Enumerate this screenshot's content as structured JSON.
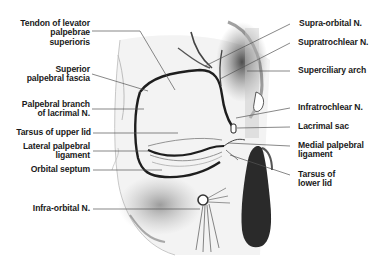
{
  "diagram": {
    "colors": {
      "background": "#ffffff",
      "label_text": "#1a1a1a",
      "leader_line": "#555555",
      "outline": "#1e1e1e",
      "shading": "#8a8a8a",
      "lacrimal_sac": "#2a2a2a"
    },
    "labels_left": [
      {
        "id": "tendon-levator",
        "lines": [
          "Tendon of levator",
          "palpebrae",
          "superioris"
        ]
      },
      {
        "id": "superior-palpebral-fascia",
        "lines": [
          "Superior",
          "palpebral fascia"
        ]
      },
      {
        "id": "palpebral-branch-lacrimal",
        "lines": [
          "Palpebral branch",
          "of lacrimal N."
        ]
      },
      {
        "id": "tarsus-upper-lid",
        "lines": [
          "Tarsus of upper lid"
        ]
      },
      {
        "id": "lateral-palpebral-ligament",
        "lines": [
          "Lateral palpebral",
          "ligament"
        ]
      },
      {
        "id": "orbital-septum",
        "lines": [
          "Orbital septum"
        ]
      },
      {
        "id": "infra-orbital-n",
        "lines": [
          "Infra-orbital N."
        ]
      }
    ],
    "labels_right": [
      {
        "id": "supra-orbital-n",
        "lines": [
          "Supra-orbital N."
        ]
      },
      {
        "id": "supratrochlear-n",
        "lines": [
          "Supratrochlear N."
        ]
      },
      {
        "id": "superciliary-arch",
        "lines": [
          "Superciliary arch"
        ]
      },
      {
        "id": "infratrochlear-n",
        "lines": [
          "Infratrochlear N."
        ]
      },
      {
        "id": "lacrimal-sac",
        "lines": [
          "Lacrimal sac"
        ]
      },
      {
        "id": "medial-palpebral-ligament",
        "lines": [
          "Medial palpebral",
          "ligament"
        ]
      },
      {
        "id": "tarsus-lower-lid",
        "lines": [
          "Tarsus of",
          "lower lid"
        ]
      }
    ]
  }
}
